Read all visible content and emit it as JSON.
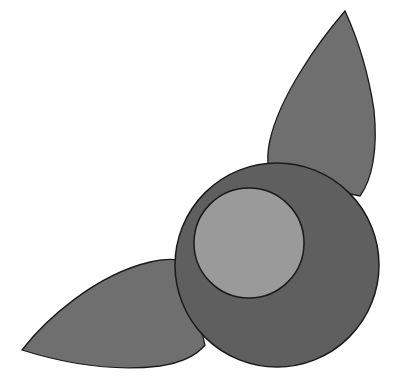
{
  "figure": {
    "colors": {
      "background": "#ffffff",
      "leaf_fill": "#6f6f6f",
      "outer_circle_fill": "#5f5f5f",
      "inner_circle_fill": "#9a9a9a",
      "stroke": "#1a1a1a"
    },
    "shapes": {
      "top_leaf": {
        "tip": [
          345,
          11
        ],
        "base_left": [
          268,
          158
        ],
        "base_right": [
          360,
          197
        ]
      },
      "bottom_leaf": {
        "tip": [
          22,
          350
        ],
        "base_top": [
          168,
          260
        ],
        "base_bottom": [
          205,
          352
        ]
      },
      "outer_circle": {
        "cx": 277,
        "cy": 265,
        "r": 102
      },
      "inner_circle": {
        "cx": 249,
        "cy": 243,
        "r": 55
      }
    }
  }
}
